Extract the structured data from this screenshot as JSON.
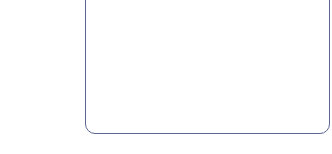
{
  "panel": {
    "border_color": "#5c6690",
    "background": "#ffffff",
    "content": ""
  }
}
